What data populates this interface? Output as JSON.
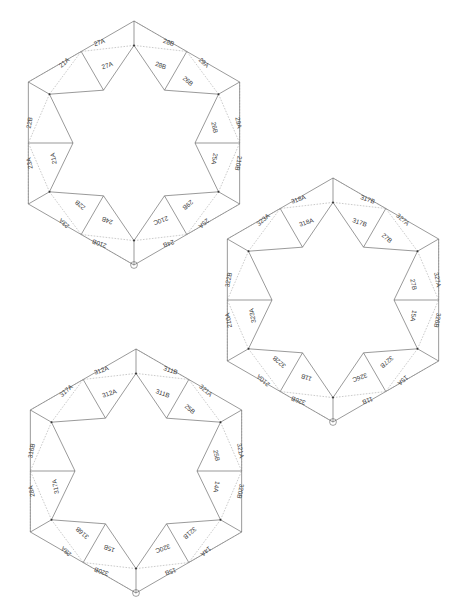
{
  "page": {
    "header_faint_text": "",
    "background_color": "#ffffff",
    "line_color": "#555555",
    "dash_color": "#8a8a8a",
    "label_color": "#3a3a3a"
  },
  "figure": {
    "title": "",
    "type": "geometric-tessellation-diagram",
    "marker_icon": "circle-vertex-marker",
    "hexagons": [
      {
        "id": "hex-1",
        "name": "upper-left-rosette",
        "series_prefix": "2",
        "marker_vertex": "left",
        "labels": [
          "27A",
          "28B",
          "27A",
          "28B",
          "29A",
          "29A",
          "26B",
          "26B",
          "210B",
          "25A",
          "25A",
          "29B",
          "24B",
          "210B",
          "210C",
          "24B",
          "23A",
          "23A",
          "22B",
          "21A",
          "22B",
          "21A"
        ]
      },
      {
        "id": "hex-2",
        "name": "middle-right-rosette",
        "series_prefix": "3",
        "marker_vertex": "left",
        "labels": [
          "318A",
          "317B",
          "318A",
          "317B",
          "327A",
          "327A",
          "27B",
          "27B",
          "326B",
          "15A",
          "15A",
          "327B",
          "11B",
          "326B",
          "326C",
          "11B",
          "210A",
          "210A",
          "322B",
          "323A",
          "322B",
          "323A"
        ]
      },
      {
        "id": "hex-3",
        "name": "lower-left-rosette",
        "series_prefix": "3",
        "marker_vertex": "left",
        "labels": [
          "312A",
          "311B",
          "312A",
          "311B",
          "321A",
          "321A",
          "25B",
          "25B",
          "320B",
          "14A",
          "14A",
          "321B",
          "15B",
          "320B",
          "320C",
          "15B",
          "28A",
          "28A",
          "316B",
          "317A",
          "316B",
          "317A"
        ]
      }
    ]
  },
  "chart_data": {
    "type": "diagram",
    "title": "",
    "panels": [
      {
        "panel": "hex-1",
        "facets": [
          {
            "label": "27A",
            "ring": "outer",
            "position": "top-left"
          },
          {
            "label": "28B",
            "ring": "outer",
            "position": "top-right"
          },
          {
            "label": "27A",
            "ring": "inner",
            "position": "top-left"
          },
          {
            "label": "28B",
            "ring": "inner",
            "position": "top-right"
          },
          {
            "label": "29A",
            "ring": "inner",
            "position": "upper-right"
          },
          {
            "label": "29A",
            "ring": "outer",
            "position": "upper-right"
          },
          {
            "label": "26B",
            "ring": "outer",
            "position": "upper-left"
          },
          {
            "label": "26B",
            "ring": "inner",
            "position": "upper-left"
          },
          {
            "label": "210B",
            "ring": "outer",
            "position": "right"
          },
          {
            "label": "25A",
            "ring": "outer",
            "position": "left-upper"
          },
          {
            "label": "25A",
            "ring": "inner",
            "position": "left-upper"
          },
          {
            "label": "29B",
            "ring": "outer",
            "position": "right-lower"
          },
          {
            "label": "24B",
            "ring": "outer",
            "position": "left-lower"
          },
          {
            "label": "210B",
            "ring": "inner",
            "position": "lower-right"
          },
          {
            "label": "210C",
            "ring": "outer",
            "position": "lower-right"
          },
          {
            "label": "24B",
            "ring": "inner",
            "position": "left-lower"
          },
          {
            "label": "23A",
            "ring": "outer",
            "position": "bottom-left"
          },
          {
            "label": "23A",
            "ring": "inner",
            "position": "bottom-left"
          },
          {
            "label": "22B",
            "ring": "inner",
            "position": "bottom"
          },
          {
            "label": "21A",
            "ring": "inner",
            "position": "bottom-right"
          },
          {
            "label": "22B",
            "ring": "outer",
            "position": "bottom"
          },
          {
            "label": "21A",
            "ring": "outer",
            "position": "bottom-right"
          }
        ]
      },
      {
        "panel": "hex-2",
        "facets": [
          {
            "label": "318A",
            "ring": "outer",
            "position": "top-left"
          },
          {
            "label": "317B",
            "ring": "outer",
            "position": "top-right"
          },
          {
            "label": "318A",
            "ring": "inner",
            "position": "top-left"
          },
          {
            "label": "317B",
            "ring": "inner",
            "position": "top-right"
          },
          {
            "label": "327A",
            "ring": "inner",
            "position": "upper-right"
          },
          {
            "label": "327A",
            "ring": "outer",
            "position": "upper-right"
          },
          {
            "label": "27B",
            "ring": "outer",
            "position": "upper-left"
          },
          {
            "label": "27B",
            "ring": "inner",
            "position": "upper-left"
          },
          {
            "label": "326B",
            "ring": "outer",
            "position": "right"
          },
          {
            "label": "15A",
            "ring": "outer",
            "position": "left-upper"
          },
          {
            "label": "15A",
            "ring": "inner",
            "position": "left-upper"
          },
          {
            "label": "327B",
            "ring": "outer",
            "position": "right-lower"
          },
          {
            "label": "11B",
            "ring": "outer",
            "position": "left-lower"
          },
          {
            "label": "326B",
            "ring": "inner",
            "position": "lower-right"
          },
          {
            "label": "326C",
            "ring": "outer",
            "position": "lower-right"
          },
          {
            "label": "11B",
            "ring": "inner",
            "position": "left-lower"
          },
          {
            "label": "210A",
            "ring": "outer",
            "position": "bottom-left"
          },
          {
            "label": "210A",
            "ring": "inner",
            "position": "bottom-left"
          },
          {
            "label": "322B",
            "ring": "inner",
            "position": "bottom"
          },
          {
            "label": "323A",
            "ring": "inner",
            "position": "bottom-right"
          },
          {
            "label": "322B",
            "ring": "outer",
            "position": "bottom"
          },
          {
            "label": "323A",
            "ring": "outer",
            "position": "bottom-right"
          }
        ]
      },
      {
        "panel": "hex-3",
        "facets": [
          {
            "label": "312A",
            "ring": "outer",
            "position": "top-left"
          },
          {
            "label": "311B",
            "ring": "outer",
            "position": "top-right"
          },
          {
            "label": "312A",
            "ring": "inner",
            "position": "top-left"
          },
          {
            "label": "311B",
            "ring": "inner",
            "position": "top-right"
          },
          {
            "label": "321A",
            "ring": "inner",
            "position": "upper-right"
          },
          {
            "label": "321A",
            "ring": "outer",
            "position": "upper-right"
          },
          {
            "label": "25B",
            "ring": "outer",
            "position": "upper-left"
          },
          {
            "label": "25B",
            "ring": "inner",
            "position": "upper-left"
          },
          {
            "label": "320B",
            "ring": "outer",
            "position": "right"
          },
          {
            "label": "14A",
            "ring": "outer",
            "position": "left-upper"
          },
          {
            "label": "14A",
            "ring": "inner",
            "position": "left-upper"
          },
          {
            "label": "321B",
            "ring": "outer",
            "position": "right-lower"
          },
          {
            "label": "15B",
            "ring": "outer",
            "position": "left-lower"
          },
          {
            "label": "320B",
            "ring": "inner",
            "position": "lower-right"
          },
          {
            "label": "320C",
            "ring": "outer",
            "position": "lower-right"
          },
          {
            "label": "15B",
            "ring": "inner",
            "position": "left-lower"
          },
          {
            "label": "28A",
            "ring": "outer",
            "position": "bottom-left"
          },
          {
            "label": "28A",
            "ring": "inner",
            "position": "bottom-left"
          },
          {
            "label": "316B",
            "ring": "inner",
            "position": "bottom"
          },
          {
            "label": "317A",
            "ring": "inner",
            "position": "bottom-right"
          },
          {
            "label": "316B",
            "ring": "outer",
            "position": "bottom"
          },
          {
            "label": "317A",
            "ring": "outer",
            "position": "bottom-right"
          }
        ]
      }
    ]
  }
}
